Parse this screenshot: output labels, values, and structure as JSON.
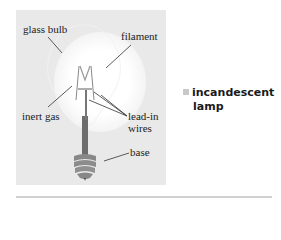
{
  "diagram": {
    "labels": {
      "glass_bulb": "glass bulb",
      "filament": "filament",
      "inert_gas": "inert gas",
      "lead_in_wires_1": "lead-in",
      "lead_in_wires_2": "wires",
      "base": "base"
    },
    "caption": {
      "line1": "incandescent",
      "line2": "lamp"
    },
    "colors": {
      "panel": "#e9e9e9",
      "caption_marker": "#c8c8c8",
      "divider": "#d0d0d0"
    }
  }
}
